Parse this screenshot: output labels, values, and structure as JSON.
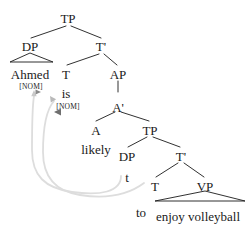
{
  "figure": {
    "kind": "syntax-tree",
    "title": "",
    "colors": {
      "text": "#1a1a1a",
      "branch": "#1a1a1a",
      "movement_arrow": "#d8d8d8"
    }
  },
  "nodes": [
    {
      "id": "tp1",
      "label": "TP",
      "type": "category",
      "x": 68,
      "y": 12
    },
    {
      "id": "dp1",
      "label": "DP",
      "type": "category",
      "x": 30,
      "y": 40
    },
    {
      "id": "tbar1",
      "label": "T'",
      "type": "category",
      "x": 101,
      "y": 40
    },
    {
      "id": "ahmed",
      "label": "Ahmed",
      "type": "word",
      "x": 30,
      "y": 68
    },
    {
      "id": "ahmed_feat",
      "label": "[NOM]",
      "type": "feature",
      "x": 31,
      "y": 83
    },
    {
      "id": "t1",
      "label": "T",
      "type": "category",
      "x": 66,
      "y": 68
    },
    {
      "id": "is",
      "label": "is",
      "type": "word",
      "x": 66,
      "y": 87
    },
    {
      "id": "is_feat",
      "label": "[NOM]",
      "type": "feature",
      "x": 68,
      "y": 103
    },
    {
      "id": "ap",
      "label": "AP",
      "type": "category",
      "x": 118,
      "y": 68
    },
    {
      "id": "abar",
      "label": "A'",
      "type": "category",
      "x": 118,
      "y": 101
    },
    {
      "id": "a",
      "label": "A",
      "type": "category",
      "x": 96,
      "y": 124
    },
    {
      "id": "likely",
      "label": "likely",
      "type": "word",
      "x": 96,
      "y": 143
    },
    {
      "id": "tp2",
      "label": "TP",
      "type": "category",
      "x": 150,
      "y": 124
    },
    {
      "id": "dp2",
      "label": "DP",
      "type": "category",
      "x": 127,
      "y": 150
    },
    {
      "id": "tbar2",
      "label": "T'",
      "type": "category",
      "x": 181,
      "y": 150
    },
    {
      "id": "trace",
      "label": "t",
      "type": "word",
      "x": 127,
      "y": 171
    },
    {
      "id": "t2",
      "label": "T",
      "type": "category",
      "x": 155,
      "y": 180
    },
    {
      "id": "vp",
      "label": "VP",
      "type": "category",
      "x": 205,
      "y": 180
    },
    {
      "id": "to",
      "label": "to",
      "type": "word",
      "x": 141,
      "y": 206
    },
    {
      "id": "enjoy_vb",
      "label": "enjoy volleyball",
      "type": "word",
      "x": 198,
      "y": 210
    }
  ],
  "branches": [
    {
      "from": "tp1",
      "to": "dp1",
      "x1": 66,
      "y1": 26,
      "x2": 31,
      "y2": 38
    },
    {
      "from": "tp1",
      "to": "tbar1",
      "x1": 71,
      "y1": 26,
      "x2": 101,
      "y2": 38
    },
    {
      "from": "tbar1",
      "to": "t1",
      "x1": 99,
      "y1": 54,
      "x2": 67,
      "y2": 65
    },
    {
      "from": "tbar1",
      "to": "ap",
      "x1": 104,
      "y1": 54,
      "x2": 117,
      "y2": 65
    },
    {
      "from": "ap",
      "to": "abar",
      "x1": 118,
      "y1": 81,
      "x2": 118,
      "y2": 92
    },
    {
      "from": "abar",
      "to": "a",
      "x1": 115,
      "y1": 112,
      "x2": 96,
      "y2": 121
    },
    {
      "from": "abar",
      "to": "tp2",
      "x1": 121,
      "y1": 112,
      "x2": 149,
      "y2": 121
    },
    {
      "from": "tp2",
      "to": "dp2",
      "x1": 147,
      "y1": 137,
      "x2": 128,
      "y2": 147
    },
    {
      "from": "tp2",
      "to": "tbar2",
      "x1": 153,
      "y1": 137,
      "x2": 180,
      "y2": 147
    },
    {
      "from": "tbar2",
      "to": "t2",
      "x1": 178,
      "y1": 163,
      "x2": 156,
      "y2": 177
    },
    {
      "from": "tbar2",
      "to": "vp",
      "x1": 184,
      "y1": 163,
      "x2": 204,
      "y2": 177
    }
  ],
  "triangles": [
    {
      "under": "dp1",
      "apex_x": 30,
      "apex_y": 53,
      "left_x": 10,
      "right_x": 53,
      "base_y": 62
    },
    {
      "under": "vp",
      "apex_x": 205,
      "apex_y": 191,
      "left_x": 155,
      "right_x": 245,
      "base_y": 201
    }
  ],
  "movement_arrows": [
    {
      "name": "dp-raising",
      "from_node": "trace",
      "to_node": "ahmed",
      "path": "M 121 176 C 121 192, 100 196, 72 192 C 45 188, 32 176, 32 150 C 32 124, 32 108, 34 96",
      "arrow_tip_x": 34,
      "arrow_tip_y": 92,
      "arrow_direction": "up"
    },
    {
      "name": "t-to-t-raising",
      "from_node": "t2",
      "to_node": "t1",
      "path": "M 144 183 C 128 194, 108 198, 82 195 C 56 191, 44 176, 44 152 C 44 126, 46 110, 54 101",
      "arrow_tip_x": 49,
      "arrow_tip_y": 87,
      "arrow_direction": "up-left"
    },
    {
      "name": "feature-check-arrow",
      "from_node": "is_feat",
      "to_node": "ahmed_feat",
      "path": "",
      "arrow_tip_x": 57,
      "arrow_tip_y": 112,
      "arrow_direction": "left"
    },
    {
      "name": "nom-arrow",
      "from_node": "ahmed_feat",
      "to_node": "ahmed_feat",
      "path": "",
      "arrow_tip_x": 39,
      "arrow_tip_y": 92,
      "arrow_direction": "right"
    }
  ]
}
